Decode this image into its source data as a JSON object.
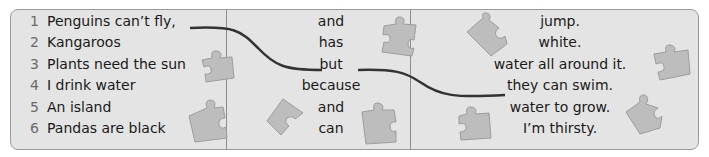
{
  "exercise": {
    "column1": [
      {
        "number": "1",
        "text": "Penguins can’t fly,"
      },
      {
        "number": "2",
        "text": "Kangaroos"
      },
      {
        "number": "3",
        "text": "Plants need the sun"
      },
      {
        "number": "4",
        "text": "I drink water"
      },
      {
        "number": "5",
        "text": "An island"
      },
      {
        "number": "6",
        "text": "Pandas are black"
      }
    ],
    "column2": [
      "and",
      "has",
      "but",
      "because",
      "and",
      "can"
    ],
    "column3": [
      "jump.",
      "white.",
      "water all around it.",
      "they can swim.",
      "water to grow.",
      "I’m thirsty."
    ],
    "example_connection": {
      "from": "Penguins can’t fly,",
      "via": "but",
      "to": "they can swim."
    }
  },
  "colors": {
    "panel_background": "#e4e4e4",
    "border": "#9a9a9a",
    "line": "#333333",
    "puzzle_piece": "#bdbdbd"
  }
}
